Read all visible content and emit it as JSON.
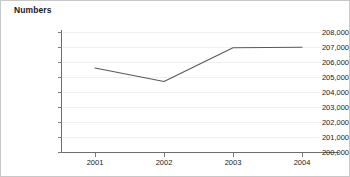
{
  "chart_data": {
    "type": "line",
    "title": "Numbers",
    "xlabel": "",
    "ylabel": "",
    "categories": [
      "2001",
      "2002",
      "2003",
      "2004"
    ],
    "series": [
      {
        "name": "Numbers",
        "values": [
          205600,
          204700,
          206950,
          206980
        ],
        "color": "#595959"
      }
    ],
    "ylim": [
      200000,
      208000
    ],
    "ytick_values": [
      200000,
      201000,
      202000,
      203000,
      204000,
      205000,
      206000,
      207000,
      208000
    ],
    "ytick_labels": [
      "208,000",
      "207,000",
      "206,000",
      "205,000",
      "204,000",
      "203,000",
      "202,000",
      "201,000",
      "200,000"
    ],
    "grid": true,
    "grid_color": "#f0f0f0",
    "legend": false,
    "axis_color": "#6e6e6e",
    "background": "#ffffff"
  }
}
